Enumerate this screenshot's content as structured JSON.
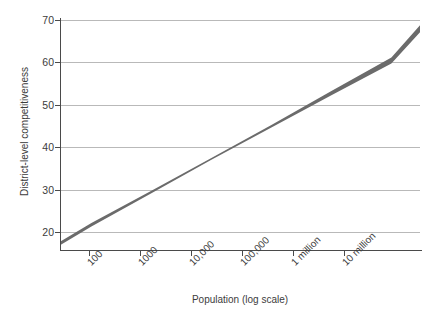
{
  "chart_data": {
    "type": "line",
    "title": "",
    "subtitle": "",
    "xlabel": "Population (log scale)",
    "ylabel": "District-level competitiveness",
    "xscale": "log",
    "grid": true,
    "legend": null,
    "xlim": [
      30,
      30000000
    ],
    "ylim": [
      17.5,
      71.5
    ],
    "x_tick_labels": [
      "100",
      "1000",
      "10,000",
      "100,000",
      "1 million",
      "10 million"
    ],
    "x_tick_values": [
      100,
      1000,
      10000,
      100000,
      1000000,
      10000000
    ],
    "y_tick_labels": [
      "20",
      "30",
      "40",
      "50",
      "60",
      "70"
    ],
    "y_tick_values": [
      20,
      30,
      40,
      50,
      60,
      70
    ],
    "series": [
      {
        "name": "Predicted district-level competitiveness",
        "type": "line_with_band",
        "color": "#5e5e5e",
        "band_color": "#6b6b6b",
        "x": [
          30,
          100,
          1000,
          10000,
          100000,
          1000000,
          10000000,
          30000000
        ],
        "values": [
          19.0,
          23.4,
          31.0,
          38.7,
          46.3,
          54.0,
          61.6,
          69.0
        ],
        "band_lower": [
          18.6,
          23.0,
          30.7,
          38.5,
          46.0,
          53.5,
          60.9,
          68.2
        ],
        "band_upper": [
          19.4,
          23.8,
          31.3,
          38.9,
          46.6,
          54.5,
          62.3,
          69.8
        ]
      }
    ],
    "annotations": [],
    "colors": {
      "axis": "#4a4a4a",
      "grid": "#b9b9b9",
      "text": "#3c3c3c",
      "band": "#666666",
      "background": "#ffffff"
    }
  }
}
